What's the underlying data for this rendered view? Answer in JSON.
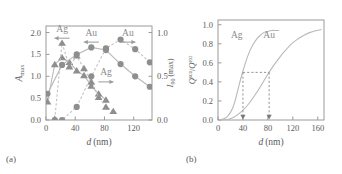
{
  "figure": {
    "panel_a_label": "(a)",
    "panel_b_label": "(b)"
  },
  "chart_data": [
    {
      "type": "scatter",
      "panel": "(a)",
      "title": "",
      "xlabel": "d (nm)",
      "xlabel_italic": "d",
      "xlabel_unit": "(nm)",
      "ylabel_left": "A_max",
      "ylabel_left_base": "A",
      "ylabel_left_sub": "max",
      "ylabel_right": "I_90 (max)",
      "ylabel_right_base": "I",
      "ylabel_right_sub": "90",
      "ylabel_right_tail": " (max)",
      "xlim": [
        0,
        145
      ],
      "ylim_left": [
        0.0,
        2.15
      ],
      "ylim_right": [
        0.0,
        1.075
      ],
      "xticks": [
        0,
        40,
        80,
        120
      ],
      "xticklabels": [
        "0",
        "40",
        "80",
        "120"
      ],
      "yticks_left": [
        0.0,
        0.5,
        1.0,
        1.5,
        2.0
      ],
      "yticklabels_left": [
        "0.0",
        "0.5",
        "1.0",
        "1.5",
        "2.0"
      ],
      "yticks_right": [
        0.0,
        0.5,
        1.0
      ],
      "yticklabels_right": [
        "0.0",
        "0.5",
        "1.0"
      ],
      "grid": false,
      "legend": "annotations",
      "annotations": [
        {
          "text": "Ag",
          "arrow": "left",
          "x": 22,
          "y": 2.02,
          "series": "Ag A_max"
        },
        {
          "text": "Au",
          "arrow": "left",
          "x": 62,
          "y": 1.93,
          "series": "Au A_max"
        },
        {
          "text": "Au",
          "arrow": "right",
          "x": 112,
          "y": 1.93,
          "series": "Au I_90"
        },
        {
          "text": "Ag",
          "arrow": "right",
          "x": 82,
          "y": 1.02,
          "series": "Ag I_90"
        }
      ],
      "series": [
        {
          "name": "Ag A_max",
          "axis": "left",
          "marker": "triangle",
          "line": "solid",
          "x": [
            2,
            12,
            22,
            32,
            42,
            52,
            62,
            72,
            82
          ],
          "values": [
            0.42,
            1.27,
            1.43,
            1.32,
            1.13,
            1.02,
            0.78,
            0.6,
            0.46
          ]
        },
        {
          "name": "Au A_max",
          "axis": "left",
          "marker": "triangle",
          "line": "dashed",
          "x": [
            12,
            22,
            32,
            42,
            52,
            62,
            72,
            82,
            92
          ],
          "values": [
            0.02,
            1.76,
            1.22,
            1.47,
            1.18,
            0.87,
            0.52,
            0.3,
            0.2
          ]
        },
        {
          "name": "Ag I_90",
          "axis": "right",
          "marker": "circle",
          "line": "solid",
          "x": [
            2,
            22,
            42,
            62,
            82,
            102,
            122,
            142
          ],
          "values": [
            0.3,
            0.63,
            0.75,
            0.83,
            0.8,
            0.64,
            0.5,
            0.38
          ]
        },
        {
          "name": "Au I_90",
          "axis": "right",
          "marker": "circle",
          "line": "dashed",
          "x": [
            12,
            22,
            42,
            62,
            82,
            102,
            122,
            142
          ],
          "values": [
            0.0,
            0.0,
            0.15,
            0.5,
            0.82,
            0.92,
            0.81,
            0.66
          ]
        }
      ]
    },
    {
      "type": "line",
      "panel": "(b)",
      "title": "",
      "xlabel": "d (nm)",
      "xlabel_italic": "d",
      "xlabel_unit": "(nm)",
      "ylabel": "Q_sca / Q_ext",
      "ylabel_num_base": "Q",
      "ylabel_num_sub": "sca",
      "ylabel_den_base": "Q",
      "ylabel_den_sub": "ext",
      "xlim": [
        0,
        170
      ],
      "ylim": [
        0.0,
        1.05
      ],
      "xticks": [
        0,
        40,
        80,
        120,
        160
      ],
      "xticklabels": [
        "0",
        "40",
        "80",
        "120",
        "160"
      ],
      "yticks": [
        0.0,
        0.2,
        0.4,
        0.6,
        0.8,
        1.0
      ],
      "yticklabels": [
        "0.0",
        "0.2",
        "0.4",
        "0.6",
        "0.8",
        "1.0"
      ],
      "grid": false,
      "reference_level": 0.5,
      "crossings": [
        {
          "label": "Ag",
          "x": 40
        },
        {
          "label": "Au",
          "x": 82
        }
      ],
      "annotations": [
        {
          "text": "Ag",
          "x": 30,
          "y": 0.86
        },
        {
          "text": "Au",
          "x": 82,
          "y": 0.86
        }
      ],
      "series": [
        {
          "name": "Ag",
          "line": "solid",
          "x": [
            2,
            8,
            14,
            20,
            26,
            32,
            38,
            44,
            50,
            56,
            62,
            68,
            74,
            80,
            86,
            92,
            98
          ],
          "values": [
            0.0,
            0.01,
            0.03,
            0.08,
            0.17,
            0.32,
            0.47,
            0.6,
            0.71,
            0.79,
            0.85,
            0.89,
            0.92,
            0.93,
            0.94,
            0.94,
            0.94
          ]
        },
        {
          "name": "Au",
          "line": "solid",
          "x": [
            8,
            18,
            28,
            38,
            48,
            58,
            68,
            78,
            88,
            98,
            108,
            118,
            128,
            138,
            148,
            158,
            166
          ],
          "values": [
            0.0,
            0.01,
            0.04,
            0.09,
            0.16,
            0.25,
            0.35,
            0.46,
            0.56,
            0.65,
            0.73,
            0.8,
            0.85,
            0.89,
            0.92,
            0.94,
            0.95
          ]
        }
      ]
    }
  ]
}
